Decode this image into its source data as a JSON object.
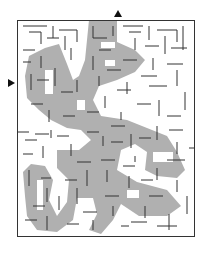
{
  "puzzle": {
    "type": "maze",
    "entrances": [
      {
        "position": "top",
        "marker": "triangle-down-arrow"
      },
      {
        "position": "left",
        "marker": "triangle-right-arrow"
      }
    ],
    "colors": {
      "wall": "#333333",
      "shaded": "#a9a9a9",
      "background": "#ffffff"
    }
  }
}
